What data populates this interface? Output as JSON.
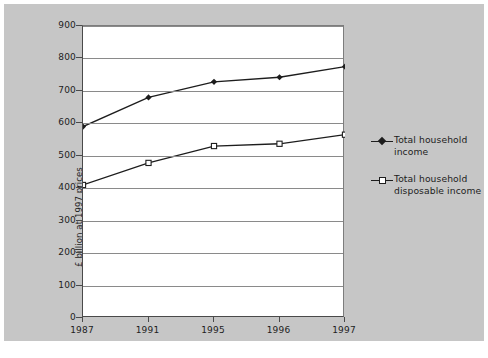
{
  "chart_data": {
    "type": "line",
    "title": "",
    "xlabel": "",
    "ylabel": "£ billion at 1997 prices",
    "categories": [
      "1987",
      "1991",
      "1995",
      "1996",
      "1997"
    ],
    "ylim": [
      0,
      900
    ],
    "yticks": [
      0,
      100,
      200,
      300,
      400,
      500,
      600,
      700,
      800,
      900
    ],
    "ytick_labels": [
      "0",
      "100",
      "200",
      "300",
      "400",
      "500",
      "600",
      "700",
      "800",
      "900"
    ],
    "grid": true,
    "legend_position": "right",
    "series": [
      {
        "name": "Total household income",
        "marker": "filled-diamond",
        "color": "#1d1d1d",
        "values": [
          590,
          680,
          728,
          742,
          775
        ]
      },
      {
        "name": "Total household disposable income",
        "marker": "open-square",
        "color": "#1d1d1d",
        "values": [
          410,
          478,
          530,
          537,
          565
        ]
      }
    ]
  },
  "legend": {
    "items": [
      {
        "label_line1": "Total household",
        "label_line2": "income",
        "symbol": "filled-diamond-line-icon"
      },
      {
        "label_line1": "Total household",
        "label_line2": "disposable income",
        "symbol": "open-square-line-icon"
      }
    ]
  },
  "colors": {
    "figure_background": "#c6c6c6",
    "plot_background": "#ffffff",
    "axis": "#4a4a4a",
    "gridline": "#8a8a8a",
    "text": "#1d1d1d",
    "series": "#1d1d1d"
  }
}
